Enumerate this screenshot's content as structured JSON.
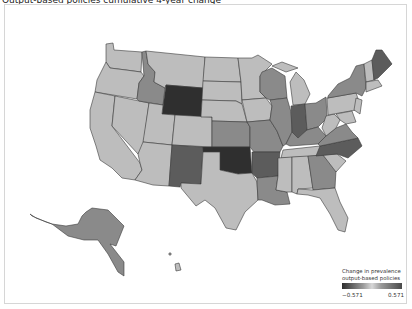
{
  "title": "Output-based policies cumulative 4-year change",
  "legend": {
    "title_line1": "Change in prevalence",
    "title_line2": "output-based policies",
    "min_label": "−0.571",
    "max_label": "0.571",
    "colors": {
      "low": "#2e2e2e",
      "mid": "#d0d0d0",
      "high": "#4a4a4a"
    }
  },
  "shades": {
    "darkest": "#2f2f2f",
    "dark": "#5c5c5c",
    "mid": "#8a8a8a",
    "light": "#bdbdbd"
  },
  "map": {
    "type": "choropleth",
    "region": "United States",
    "states_darkest": [
      "Wyoming",
      "Oklahoma"
    ],
    "states_dark": [
      "Indiana",
      "Arkansas",
      "North Carolina",
      "Maine",
      "New Mexico"
    ],
    "states_mid": [
      "Idaho",
      "Alaska",
      "Wisconsin",
      "Illinois",
      "Ohio",
      "Kansas",
      "Missouri",
      "Louisiana",
      "Georgia",
      "Kentucky",
      "New York",
      "Virginia"
    ],
    "states_light": [
      "Washington",
      "Oregon",
      "California",
      "Nevada",
      "Utah",
      "Arizona",
      "Montana",
      "Colorado",
      "North Dakota",
      "South Dakota",
      "Nebraska",
      "Texas",
      "Minnesota",
      "Iowa",
      "Michigan",
      "Tennessee",
      "Mississippi",
      "Alabama",
      "Florida",
      "South Carolina",
      "West Virginia",
      "Pennsylvania",
      "New Jersey",
      "Hawaii",
      "Vermont",
      "New Hampshire",
      "Massachusetts",
      "Connecticut"
    ]
  }
}
